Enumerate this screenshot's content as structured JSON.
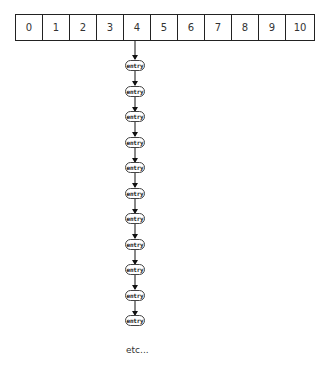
{
  "array": {
    "cells": [
      "0",
      "1",
      "2",
      "3",
      "4",
      "5",
      "6",
      "7",
      "8",
      "9",
      "10"
    ],
    "pointer_index": 4
  },
  "chain": {
    "entries": [
      "entry",
      "entry",
      "entry",
      "entry",
      "entry",
      "entry",
      "entry",
      "entry",
      "entry",
      "entry",
      "entry",
      "entry"
    ],
    "continuation": "etc..."
  },
  "colors": {
    "stroke": "#222222",
    "text": "#333333",
    "background": "#ffffff"
  }
}
